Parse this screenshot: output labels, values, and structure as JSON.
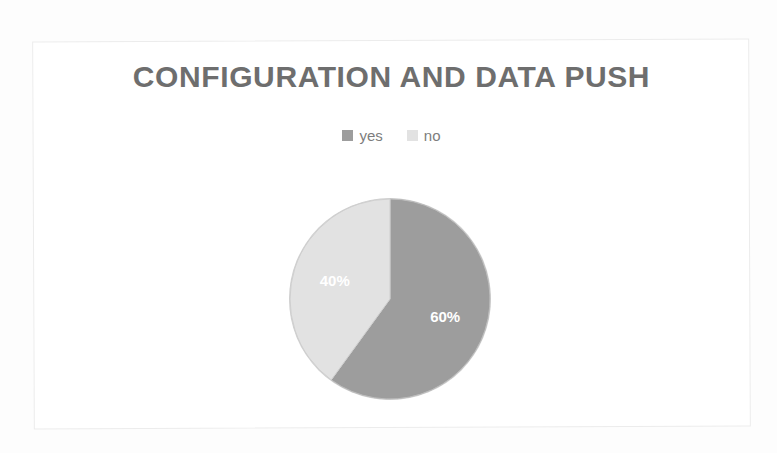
{
  "chart_data": {
    "type": "pie",
    "title": "CONFIGURATION AND DATA PUSH",
    "categories": [
      "yes",
      "no"
    ],
    "values": [
      60,
      40
    ],
    "data_labels": [
      "60%",
      "40%"
    ],
    "units": "percent",
    "legend": {
      "position": "top",
      "entries": [
        {
          "label": "yes",
          "color": "#9d9d9d"
        },
        {
          "label": "no",
          "color": "#e2e2e2"
        }
      ]
    },
    "start_angle_deg": 0,
    "direction": "clockwise",
    "grid": false,
    "xlabel": "",
    "ylabel": "",
    "slices": [
      {
        "name": "yes",
        "value": 60,
        "label": "60%",
        "color": "#9d9d9d",
        "start_deg": 0,
        "end_deg": 216
      },
      {
        "name": "no",
        "value": 40,
        "label": "40%",
        "color": "#e2e2e2",
        "start_deg": 216,
        "end_deg": 360
      }
    ]
  },
  "colors": {
    "title_text": "#6e6e6e",
    "legend_text": "#7d7d7d",
    "slice_yes": "#9d9d9d",
    "slice_no": "#e2e2e2",
    "slice_outline": "#bdbdbd",
    "label_text": "#ffffff",
    "frame_border": "#ececec",
    "background": "#ffffff"
  }
}
